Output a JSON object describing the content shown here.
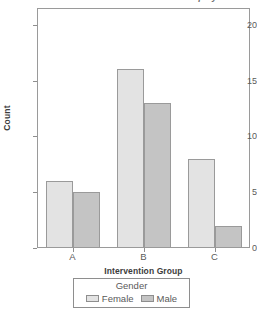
{
  "chart_data": {
    "type": "bar",
    "title": "Intervention Group by Gender",
    "xlabel": "Intervention Group",
    "ylabel": "Count",
    "categories": [
      "A",
      "B",
      "C"
    ],
    "series": [
      {
        "name": "Female",
        "values": [
          6,
          16,
          8
        ],
        "color": "#e3e3e3"
      },
      {
        "name": "Male",
        "values": [
          5,
          13,
          2
        ],
        "color": "#c4c4c4"
      }
    ],
    "ylim": [
      0,
      21.5
    ],
    "yticks": [
      0,
      5,
      10,
      15,
      20
    ],
    "ytick_labels": [
      "0",
      "5",
      "10",
      "15",
      "20"
    ],
    "grid": false,
    "legend": {
      "title": "Gender",
      "position": "bottom"
    }
  },
  "legend": {
    "title": "Gender",
    "items": [
      {
        "label": "Female"
      },
      {
        "label": "Male"
      }
    ]
  },
  "axes": {
    "y_title": "Count",
    "x_title": "Intervention Group"
  }
}
